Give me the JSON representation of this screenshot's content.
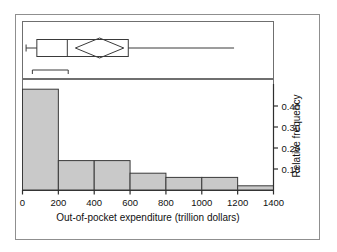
{
  "chart_data": {
    "type": "bar",
    "title": "",
    "subtitle": "",
    "xlabel": "Out-of-pocket expenditure (trillion dollars)",
    "ylabel": "Relative frequency",
    "categories": [
      "0-200",
      "200-400",
      "400-600",
      "600-800",
      "800-1000",
      "1000-1200",
      "1200-1400"
    ],
    "bin_edges": [
      0,
      200,
      400,
      600,
      800,
      1000,
      1200,
      1400
    ],
    "values": [
      0.48,
      0.14,
      0.14,
      0.08,
      0.06,
      0.06,
      0.02
    ],
    "xlim": [
      0,
      1400
    ],
    "ylim": [
      0,
      0.5
    ],
    "x_ticks": [
      0,
      200,
      400,
      600,
      800,
      1000,
      1200,
      1400
    ],
    "x_tick_labels": [
      "0",
      "200",
      "400",
      "600",
      "800",
      "1000",
      "1200",
      "1400"
    ],
    "y_ticks": [
      0.1,
      0.2,
      0.3,
      0.4
    ],
    "y_tick_labels": [
      "0.10",
      "0.20",
      "0.30",
      "0.40"
    ],
    "y_axis_position": "right",
    "grid": false,
    "legend": false,
    "bar_fill_color": "#c9c9c9",
    "bar_edge_color": "#3a3a3a",
    "axis_color": "#2e2e2e",
    "frame_color": "#8f8f8f"
  },
  "boxplot": {
    "description": "Horizontal box plot with mean diamond above histogram",
    "whisker_min": 20,
    "box_q1": 80,
    "median": 250,
    "box_q3": 590,
    "whisker_max": 1180,
    "mean_diamond_center": 430,
    "mean_diamond_half_width": 135,
    "scale_bar_start": 55,
    "scale_bar_end": 255
  },
  "axis_titles": {
    "x": "Out-of-pocket expenditure (trillion dollars)",
    "y": "Relative frequency"
  }
}
